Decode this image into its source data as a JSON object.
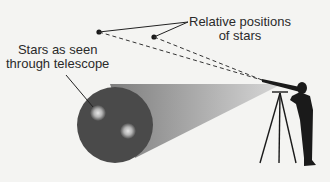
{
  "labels": {
    "relative_positions": [
      "Relative positions",
      "of stars"
    ],
    "stars_seen": [
      "Stars as seen",
      "through telescope"
    ]
  },
  "colors": {
    "background": "#f4f4f2",
    "view_circle": "#4a4a4a",
    "cone_dark": "#8a8a8a",
    "cone_light": "#cfcfcf",
    "star_glow": "#d8d8d8",
    "silhouette": "#1a1a1a",
    "line": "#222222"
  }
}
